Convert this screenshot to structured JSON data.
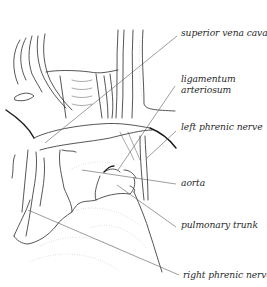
{
  "figure": {
    "labels": [
      {
        "id": "superior-vena-cava",
        "text": "superior vena cava"
      },
      {
        "id": "ligamentum-arteriosum",
        "lines": [
          "ligamentum",
          "arteriosum"
        ]
      },
      {
        "id": "left-phrenic-nerve",
        "text": "left phrenic nerve"
      },
      {
        "id": "aorta",
        "text": "aorta"
      },
      {
        "id": "pulmonary-trunk",
        "text": "pulmonary trunk"
      },
      {
        "id": "right-phrenic-nerve",
        "text": "right phrenic nerve"
      }
    ]
  }
}
